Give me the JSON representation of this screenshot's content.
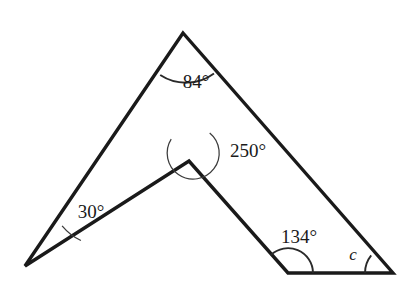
{
  "figure": {
    "background_color": "#ffffff",
    "stroke_color": "#1a1a1a",
    "arc_color": "#3b3b3b",
    "vertices": [
      {
        "name": "apex-top",
        "x": 183,
        "y": 33
      },
      {
        "name": "right-bottom",
        "x": 393,
        "y": 273
      },
      {
        "name": "notch-bottom",
        "x": 288,
        "y": 273
      },
      {
        "name": "reflex-middle",
        "x": 189,
        "y": 161
      },
      {
        "name": "left-point",
        "x": 25,
        "y": 266
      }
    ],
    "labels": {
      "apex": "84°",
      "reflex": "250°",
      "left": "30°",
      "notch": "134°",
      "unknown": "c"
    },
    "label_positions": {
      "apex": {
        "x": 196,
        "y": 88
      },
      "reflex": {
        "x": 248,
        "y": 157
      },
      "left": {
        "x": 91,
        "y": 218
      },
      "notch": {
        "x": 299,
        "y": 243
      },
      "unknown": {
        "x": 353,
        "y": 260
      }
    },
    "angle_values": {
      "apex": 84,
      "reflex": 250,
      "left": 30,
      "notch": 134,
      "unknown": null
    }
  }
}
